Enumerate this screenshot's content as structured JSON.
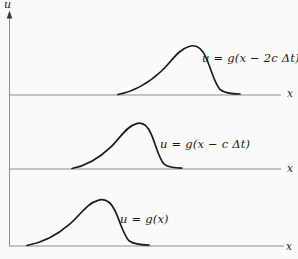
{
  "figure": {
    "y_axis_label": "u",
    "colors": {
      "curve": "#1d1d1d",
      "axis": "#8f8f8f",
      "arrow": "#3c3c3c",
      "text": "#1a1a1a",
      "background": "#fafaf8"
    },
    "rows": [
      {
        "curve_label": "u = g(x − 2c Δt)",
        "x_axis_label": "x"
      },
      {
        "curve_label": "u = g(x − c Δt)",
        "x_axis_label": "x"
      },
      {
        "curve_label": "u = g(x)",
        "x_axis_label": "x"
      }
    ]
  }
}
